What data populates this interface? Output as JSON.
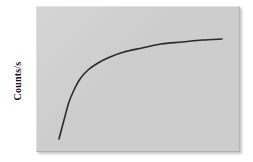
{
  "figure": {
    "background_color": "#ffffff",
    "panel": {
      "name": "plot-panel",
      "fill_color": "#cdcdcd",
      "x": 36,
      "y": 6,
      "width": 204,
      "height": 146,
      "has_drop_shadow": true,
      "has_bevel_edge": true
    }
  },
  "axes": {
    "ylabel": "Counts/s",
    "ylabel_rotation_deg": -90,
    "xlabel": "",
    "tick_labels_visible": false,
    "axis_lines_visible": false,
    "grid": false
  },
  "chart_data": {
    "type": "line",
    "title": "",
    "subtitle": "",
    "xlabel": "",
    "ylabel": "Counts/s",
    "grid": false,
    "legend": [],
    "legend_position": "none",
    "annotations": [],
    "axis_ranges": {
      "xlim": [
        0,
        1
      ],
      "ylim": [
        0,
        1
      ]
    },
    "series": [
      {
        "name": "counts-rate-curve",
        "color": "#2a2a2a",
        "line_width": 1.6,
        "x": [
          0.0,
          0.05,
          0.1,
          0.15,
          0.2,
          0.26,
          0.33,
          0.41,
          0.5,
          0.6,
          0.7,
          0.8,
          0.9,
          1.0
        ],
        "y": [
          0.0,
          0.26,
          0.43,
          0.55,
          0.64,
          0.72,
          0.79,
          0.85,
          0.89,
          0.93,
          0.96,
          0.98,
          0.99,
          1.0
        ],
        "pixel_points": [
          [
            59,
            139
          ],
          [
            64,
            120
          ],
          [
            69,
            102
          ],
          [
            74,
            90
          ],
          [
            80,
            79
          ],
          [
            88,
            70
          ],
          [
            98,
            63
          ],
          [
            110,
            57
          ],
          [
            124,
            52
          ],
          [
            142,
            48
          ],
          [
            161,
            44
          ],
          [
            182,
            42
          ],
          [
            202,
            40
          ],
          [
            222,
            39
          ]
        ]
      }
    ]
  }
}
